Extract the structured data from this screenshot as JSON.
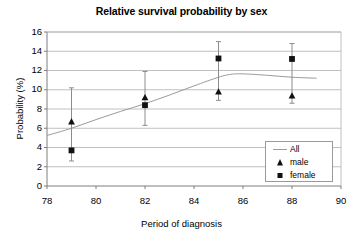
{
  "chart_data": {
    "type": "scatter",
    "title": "Relative survival probability by sex",
    "xlabel": "Period of diagnosis",
    "ylabel": "Probability (%)",
    "xlim": [
      78,
      90
    ],
    "ylim": [
      0,
      16
    ],
    "xticks": [
      78,
      80,
      82,
      84,
      86,
      88,
      90
    ],
    "yticks": [
      0,
      2,
      4,
      6,
      8,
      10,
      12,
      14,
      16
    ],
    "grid": "horizontal",
    "legend_position": "lower-right",
    "x": [
      79,
      82,
      85,
      88
    ],
    "series": [
      {
        "name": "All",
        "marker": "line",
        "type": "line",
        "x": [
          78,
          79,
          80,
          81,
          82,
          83,
          84,
          85,
          85.5,
          86,
          87,
          88,
          89
        ],
        "values": [
          5.25,
          6.0,
          6.9,
          7.75,
          8.55,
          9.45,
          10.4,
          11.3,
          11.6,
          11.65,
          11.5,
          11.3,
          11.2
        ]
      },
      {
        "name": "male",
        "marker": "triangle",
        "type": "scatter",
        "values": [
          6.7,
          9.2,
          9.8,
          9.4
        ],
        "err_low": [
          4.4,
          7.6,
          8.9,
          8.6
        ],
        "err_high": [
          10.2,
          11.9,
          15.0,
          14.8
        ]
      },
      {
        "name": "female",
        "marker": "square",
        "type": "scatter",
        "values": [
          3.7,
          8.4,
          13.25,
          13.2
        ],
        "err_low": [
          2.6,
          6.3,
          8.9,
          8.6
        ],
        "err_high": [
          10.2,
          11.9,
          15.0,
          14.8
        ]
      }
    ]
  },
  "legend": {
    "items": [
      {
        "label": "All",
        "symbol": "line"
      },
      {
        "label": "male",
        "symbol": "triangle"
      },
      {
        "label": "female",
        "symbol": "square"
      }
    ]
  },
  "colors": {
    "axis": "#7f7f7f",
    "grid": "#b0b0b0",
    "marker": "#111111",
    "error_bar": "#8c8c8c",
    "curve": "#9a9a9a",
    "text": "#000000"
  }
}
